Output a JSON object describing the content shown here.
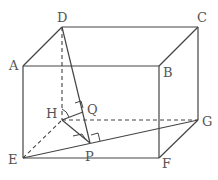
{
  "diagram": {
    "type": "cuboid-with-perpendiculars",
    "vertices": {
      "A": "A",
      "B": "B",
      "C": "C",
      "D": "D",
      "E": "E",
      "F": "F",
      "G": "G",
      "H": "H",
      "P": "P",
      "Q": "Q"
    },
    "solid_edges": [
      "AB",
      "BC",
      "CD",
      "DA",
      "AE",
      "BF",
      "CG",
      "EF",
      "FG",
      "DP",
      "EG",
      "HP",
      "HQ"
    ],
    "dashed_edges": [
      "DH",
      "EH",
      "HG"
    ],
    "right_angles": [
      "HQ⊥DP at Q",
      "DP⊥EG at P",
      "DH⊥plane at H"
    ]
  }
}
